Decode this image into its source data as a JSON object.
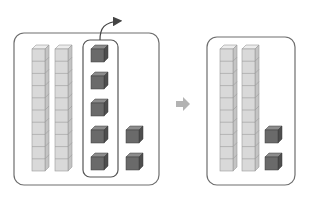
{
  "diagram": {
    "colors": {
      "panel_border": "#6e6e6e",
      "rod_face": "#d9d9d9",
      "rod_top": "#ececec",
      "rod_side": "#c4c4c4",
      "rod_line": "#9a9a9a",
      "unit_face": "#6a6a6a",
      "unit_top": "#8c8c8c",
      "unit_side": "#4e4e4e",
      "arrow": "#b3b3b3",
      "curve_arrow": "#444444"
    },
    "left_panel": {
      "tens_rods": 2,
      "cubes_per_rod": 10,
      "grouped_units": 5,
      "extra_units": 2
    },
    "transition_arrow": "right-arrow",
    "right_panel": {
      "tens_rods": 2,
      "cubes_per_rod": 10,
      "units": 2
    }
  }
}
